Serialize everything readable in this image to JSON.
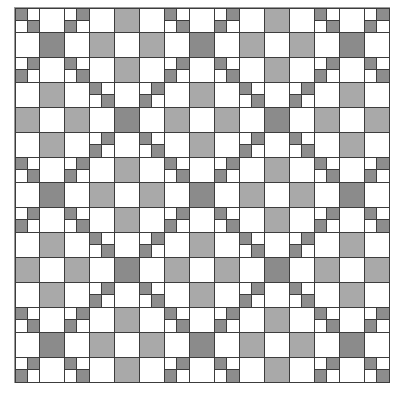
{
  "diagram": {
    "type": "quilt-pattern",
    "grid": {
      "rows": 15,
      "cols": 15,
      "cell_px": 25
    },
    "colors": {
      "white": "#ffffff",
      "medium_gray": "#a9a9a9",
      "dark_gray": "#8b8b8b",
      "four_patch_dark": "#8d8d8d",
      "line": "#3c3c3c",
      "outer_border": "#9a9a9a"
    },
    "legend": {
      "W": "white square",
      "G": "medium gray square",
      "D": "dark gray square",
      "F1": "four-patch, dark top-left and bottom-right",
      "F2": "four-patch, dark top-right and bottom-left"
    },
    "tile": [
      [
        "F1",
        "W",
        "F2",
        "W",
        "G",
        "W"
      ],
      [
        "W",
        "D",
        "W",
        "G",
        "W",
        "G"
      ],
      [
        "F2",
        "W",
        "F1",
        "W",
        "G",
        "W"
      ],
      [
        "W",
        "G",
        "W",
        "F1",
        "W",
        "F2"
      ],
      [
        "G",
        "W",
        "G",
        "W",
        "D",
        "W"
      ],
      [
        "W",
        "G",
        "W",
        "F2",
        "W",
        "F1"
      ]
    ]
  }
}
